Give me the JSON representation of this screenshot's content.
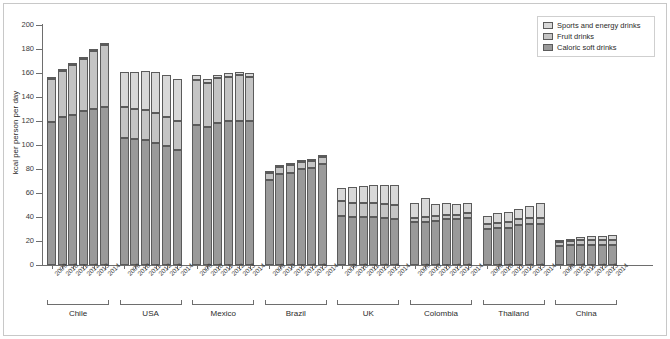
{
  "chart_data": {
    "type": "bar",
    "subtype": "stacked-grouped",
    "title": "",
    "xlabel": "",
    "ylabel": "kcal per person per day",
    "ylim": [
      0,
      200
    ],
    "yticks": [
      0,
      20,
      40,
      60,
      80,
      100,
      120,
      140,
      160,
      180,
      200
    ],
    "grid": false,
    "legend_position": "top-right",
    "legend": [
      {
        "name": "Sports and energy drinks",
        "color": "#d8d8d8"
      },
      {
        "name": "Fruit drinks",
        "color": "#c4c4c4"
      },
      {
        "name": "Caloric soft drinks",
        "color": "#9a9a9a"
      }
    ],
    "series_order": [
      "Caloric soft drinks",
      "Fruit drinks",
      "Sports and energy drinks"
    ],
    "categories": [
      "2009",
      "2010",
      "2011",
      "2012",
      "2013",
      "2014"
    ],
    "groups": [
      {
        "name": "Chile",
        "years": [
          "2009",
          "2010",
          "2011",
          "2012",
          "2013",
          "2014"
        ],
        "caloric_soft_drinks": [
          119,
          123,
          125,
          128,
          130,
          132
        ],
        "fruit_drinks": [
          36,
          39,
          42,
          44,
          48,
          51
        ],
        "sports_and_energy_drinks": [
          1,
          1,
          1,
          1,
          2,
          2
        ],
        "totals": [
          156,
          163,
          168,
          173,
          180,
          185
        ]
      },
      {
        "name": "USA",
        "years": [
          "2009",
          "2010",
          "2011",
          "2012",
          "2013",
          "2014"
        ],
        "caloric_soft_drinks": [
          106,
          105,
          104,
          102,
          99,
          96
        ],
        "fruit_drinks": [
          26,
          25,
          25,
          25,
          24,
          24
        ],
        "sports_and_energy_drinks": [
          29,
          31,
          33,
          34,
          35,
          35
        ],
        "totals": [
          161,
          161,
          162,
          161,
          158,
          155
        ]
      },
      {
        "name": "Mexico",
        "years": [
          "2009",
          "2010",
          "2011",
          "2012",
          "2013",
          "2014"
        ],
        "caloric_soft_drinks": [
          117,
          115,
          118,
          120,
          120,
          120
        ],
        "fruit_drinks": [
          37,
          37,
          38,
          37,
          38,
          37
        ],
        "sports_and_energy_drinks": [
          4,
          3,
          2,
          3,
          3,
          3
        ],
        "totals": [
          158,
          155,
          158,
          160,
          161,
          160
        ]
      },
      {
        "name": "Brazil",
        "years": [
          "2009",
          "2010",
          "2011",
          "2012",
          "2013",
          "2014"
        ],
        "caloric_soft_drinks": [
          71,
          76,
          77,
          80,
          81,
          84
        ],
        "fruit_drinks": [
          6,
          6,
          6,
          6,
          6,
          6
        ],
        "sports_and_energy_drinks": [
          1,
          1,
          1,
          1,
          1,
          1
        ],
        "totals": [
          78,
          83,
          84,
          87,
          88,
          91
        ]
      },
      {
        "name": "UK",
        "years": [
          "2009",
          "2010",
          "2011",
          "2012",
          "2013",
          "2014"
        ],
        "caloric_soft_drinks": [
          41,
          40,
          40,
          40,
          39,
          38
        ],
        "fruit_drinks": [
          12,
          12,
          12,
          12,
          12,
          12
        ],
        "sports_and_energy_drinks": [
          11,
          13,
          14,
          15,
          16,
          17
        ],
        "totals": [
          64,
          65,
          66,
          67,
          67,
          67
        ]
      },
      {
        "name": "Colombia",
        "years": [
          "2009",
          "2010",
          "2011",
          "2012",
          "2013",
          "2014"
        ],
        "caloric_soft_drinks": [
          36,
          36,
          37,
          38,
          38,
          39
        ],
        "fruit_drinks": [
          3,
          4,
          4,
          4,
          4,
          4
        ],
        "sports_and_energy_drinks": [
          13,
          16,
          10,
          10,
          9,
          9
        ],
        "totals": [
          52,
          56,
          51,
          52,
          51,
          52
        ]
      },
      {
        "name": "Thailand",
        "years": [
          "2009",
          "2010",
          "2011",
          "2012",
          "2013",
          "2014"
        ],
        "caloric_soft_drinks": [
          30,
          31,
          31,
          33,
          34,
          34
        ],
        "fruit_drinks": [
          4,
          4,
          5,
          5,
          5,
          5
        ],
        "sports_and_energy_drinks": [
          7,
          8,
          8,
          9,
          10,
          13
        ],
        "totals": [
          41,
          43,
          44,
          47,
          49,
          52
        ]
      },
      {
        "name": "China",
        "years": [
          "2009",
          "2010",
          "2011",
          "2012",
          "2013",
          "2014"
        ],
        "caloric_soft_drinks": [
          16,
          17,
          17,
          17,
          17,
          17
        ],
        "fruit_drinks": [
          3,
          3,
          4,
          4,
          4,
          4
        ],
        "sports_and_energy_drinks": [
          1,
          2,
          2,
          3,
          3,
          4
        ],
        "totals": [
          20,
          22,
          23,
          24,
          24,
          25
        ]
      }
    ]
  }
}
